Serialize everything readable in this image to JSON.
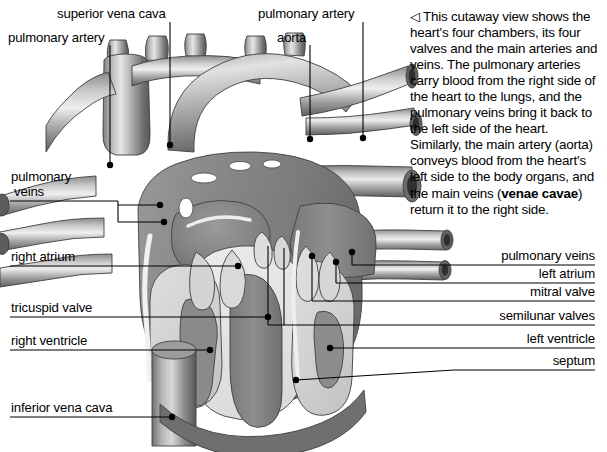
{
  "diagram": {
    "palette": {
      "background": "#ffffff",
      "ink": "#000000",
      "vessel_mid": "#8d8d8d",
      "vessel_light": "#d8d8d8",
      "vessel_dark": "#5a5a5a",
      "muscle_mid": "#8a8a8a",
      "muscle_dark": "#6e6e6e",
      "cavity_light": "#cfcfcf",
      "cavity_pale": "#e8e8e8",
      "outline": "#3a3a3a"
    }
  },
  "caption": {
    "arrow_glyph": "◁",
    "arrow_name": "left-pointing-triangle",
    "text_before_bold": " This cutaway view shows the heart's four chambers, its four valves and the main arteries and veins. The pulmonary arteries carry blood from the right side of the heart to the lungs, and the pulmonary veins bring it back to the left side of the heart. Similarly, the main artery (aorta) conveys blood from the heart's left side to the body organs, and the main veins (",
    "bold_text": "venae cavae",
    "text_after_bold": ") return it to the right side."
  },
  "labels_left": [
    {
      "id": "superior-vena-cava",
      "text": "superior vena cava"
    },
    {
      "id": "pulmonary-artery-left",
      "text": "pulmonary artery"
    },
    {
      "id": "pulmonary-veins-left",
      "text": "pulmonary"
    },
    {
      "id": "pulmonary-veins-left-2",
      "text": "veins"
    },
    {
      "id": "right-atrium",
      "text": "right atrium"
    },
    {
      "id": "tricuspid-valve",
      "text": "tricuspid valve"
    },
    {
      "id": "right-ventricle",
      "text": "right ventricle"
    },
    {
      "id": "inferior-vena-cava",
      "text": "inferior vena cava"
    }
  ],
  "labels_top": [
    {
      "id": "pulmonary-artery-top",
      "text": "pulmonary artery"
    },
    {
      "id": "aorta",
      "text": "aorta"
    }
  ],
  "labels_right": [
    {
      "id": "pulmonary-veins-right",
      "text": "pulmonary veins"
    },
    {
      "id": "left-atrium",
      "text": "left atrium"
    },
    {
      "id": "mitral-valve",
      "text": "mitral valve"
    },
    {
      "id": "semilunar-valves",
      "text": "semilunar valves"
    },
    {
      "id": "left-ventricle",
      "text": "left ventricle"
    },
    {
      "id": "septum",
      "text": "septum"
    }
  ]
}
